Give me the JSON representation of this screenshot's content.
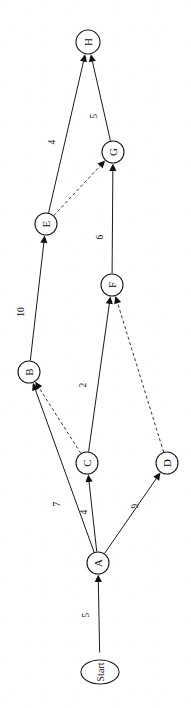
{
  "diagram": {
    "type": "directed-graph",
    "orientation_degrees": -90,
    "nodes": [
      {
        "id": "Start",
        "label": "Start",
        "shape": "ellipse",
        "x": 100,
        "y": 672,
        "rx": 19,
        "ry": 12
      },
      {
        "id": "A",
        "label": "A",
        "shape": "circle",
        "x": 98,
        "y": 563,
        "rx": 11,
        "ry": 11
      },
      {
        "id": "C",
        "label": "C",
        "shape": "circle",
        "x": 87,
        "y": 463,
        "rx": 11,
        "ry": 11
      },
      {
        "id": "D",
        "label": "D",
        "shape": "circle",
        "x": 167,
        "y": 463,
        "rx": 11,
        "ry": 11
      },
      {
        "id": "B",
        "label": "B",
        "shape": "circle",
        "x": 29,
        "y": 372,
        "rx": 11,
        "ry": 11
      },
      {
        "id": "F",
        "label": "F",
        "shape": "circle",
        "x": 112,
        "y": 285,
        "rx": 11,
        "ry": 11
      },
      {
        "id": "E",
        "label": "E",
        "shape": "circle",
        "x": 46,
        "y": 224,
        "rx": 11,
        "ry": 11
      },
      {
        "id": "G",
        "label": "G",
        "shape": "circle",
        "x": 113,
        "y": 152,
        "rx": 11,
        "ry": 11
      },
      {
        "id": "H",
        "label": "H",
        "shape": "circle",
        "x": 88,
        "y": 42,
        "rx": 12,
        "ry": 12
      }
    ],
    "edges": [
      {
        "id": "start-a",
        "from": "Start",
        "to": "A",
        "weight": "5",
        "style": "solid",
        "arrow": true,
        "label_x": 86,
        "label_y": 615
      },
      {
        "id": "a-c",
        "from": "A",
        "to": "C",
        "weight": "4",
        "style": "solid",
        "arrow": true,
        "label_x": 84,
        "label_y": 512
      },
      {
        "id": "a-b",
        "from": "A",
        "to": "B",
        "weight": "7",
        "style": "solid",
        "arrow": true,
        "label_x": 57,
        "label_y": 504
      },
      {
        "id": "a-d",
        "from": "A",
        "to": "D",
        "weight": "9",
        "style": "solid",
        "arrow": true,
        "label_x": 135,
        "label_y": 506
      },
      {
        "id": "c-f",
        "from": "C",
        "to": "F",
        "weight": "2",
        "style": "solid",
        "arrow": true,
        "label_x": 83,
        "label_y": 385
      },
      {
        "id": "c-b",
        "from": "C",
        "to": "B",
        "weight": "",
        "style": "dashed",
        "arrow": true,
        "label_x": 0,
        "label_y": 0
      },
      {
        "id": "d-f",
        "from": "D",
        "to": "F",
        "weight": "",
        "style": "dashed",
        "arrow": true,
        "label_x": 0,
        "label_y": 0
      },
      {
        "id": "b-e",
        "from": "B",
        "to": "E",
        "weight": "10",
        "style": "solid",
        "arrow": true,
        "label_x": 21,
        "label_y": 312
      },
      {
        "id": "f-g",
        "from": "F",
        "to": "G",
        "weight": "6",
        "style": "solid",
        "arrow": true,
        "label_x": 100,
        "label_y": 237
      },
      {
        "id": "e-g",
        "from": "E",
        "to": "G",
        "weight": "",
        "style": "dashed",
        "arrow": true,
        "label_x": 0,
        "label_y": 0
      },
      {
        "id": "e-h",
        "from": "E",
        "to": "H",
        "weight": "4",
        "style": "solid",
        "arrow": true,
        "label_x": 52,
        "label_y": 142
      },
      {
        "id": "g-h",
        "from": "G",
        "to": "H",
        "weight": "5",
        "style": "solid",
        "arrow": true,
        "label_x": 94,
        "label_y": 116
      }
    ],
    "colors": {
      "ink": "#111111",
      "stroke": "#1a1a1a",
      "background": "#ffffff"
    }
  }
}
